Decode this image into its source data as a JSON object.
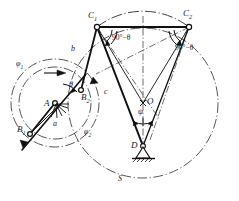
{
  "figure": {
    "background_color": "#ffffff",
    "line_color": "#1a1a1a"
  },
  "points": {
    "A": {
      "label": "A",
      "x": 55,
      "y": 103,
      "type": "fixed-pivot-hatched"
    },
    "B1": {
      "label": "B",
      "sub": "1",
      "x": 30,
      "y": 134,
      "type": "pin-joint"
    },
    "B2": {
      "label": "B",
      "sub": "2",
      "x": 81,
      "y": 90,
      "type": "pin-joint"
    },
    "C1": {
      "label": "C",
      "sub": "1",
      "x": 97,
      "y": 27,
      "type": "pin-joint"
    },
    "C2": {
      "label": "C",
      "sub": "2",
      "x": 189,
      "y": 27,
      "type": "pin-joint"
    },
    "O": {
      "label": "O",
      "x": 143,
      "y": 103,
      "type": "construction-point"
    },
    "D": {
      "label": "D",
      "x": 143,
      "y": 146,
      "type": "fixed-pivot-ground"
    }
  },
  "links": [
    {
      "name": "crank-a",
      "label": "a",
      "from": "A",
      "to": "B1",
      "label_x": 53,
      "label_y": 124
    },
    {
      "name": "coupler-b",
      "label": "b",
      "from": "B2",
      "to": "C1",
      "label_x": 72,
      "label_y": 49
    },
    {
      "name": "coupler-c",
      "label": "c",
      "from": "C1",
      "to": "D",
      "label_x": 105,
      "label_y": 92
    }
  ],
  "angles": [
    {
      "name": "theta-at-A",
      "label": "θ",
      "x": 71,
      "y": 86
    },
    {
      "name": "angle-at-C1",
      "label": "90°−θ",
      "x": 113,
      "y": 38
    },
    {
      "name": "angle-at-C2",
      "label": "90°−θ",
      "x": 176,
      "y": 47
    },
    {
      "name": "psi-at-O",
      "label": "ψ",
      "x": 140,
      "y": 112
    }
  ],
  "circles": [
    {
      "name": "phi-1",
      "label": "φ",
      "sub": "1",
      "label_x": 18,
      "label_y": 65,
      "style": "dash-dot"
    },
    {
      "name": "phi-2",
      "label": "φ",
      "sub": "2",
      "label_x": 86,
      "label_y": 132,
      "style": "dash-dot"
    },
    {
      "name": "S",
      "label": "S",
      "sub": "",
      "label_x": 120,
      "label_y": 179,
      "style": "dash-dot"
    }
  ],
  "colors": {
    "stroke": "#1a1a1a",
    "construction": "#3a3a3a",
    "fill": "#ffffff"
  }
}
